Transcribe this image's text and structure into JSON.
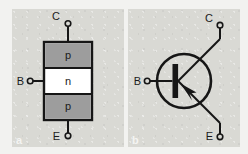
{
  "figure": {
    "background_color": "#f2f2f0",
    "panel_color": "#d9d9d4"
  },
  "panels": [
    {
      "id": "a",
      "caption": "a",
      "kind": "layer-structure",
      "body_fill": "#ffffff",
      "region_fill": "#9d9d9d",
      "stroke": "#161616",
      "regions": [
        {
          "label": "p",
          "position": "top"
        },
        {
          "label": "n",
          "position": "middle"
        },
        {
          "label": "p",
          "position": "bottom"
        }
      ],
      "terminals": [
        {
          "label": "C",
          "name": "collector",
          "position": "top"
        },
        {
          "label": "B",
          "name": "base",
          "position": "left"
        },
        {
          "label": "E",
          "name": "emitter",
          "position": "bottom"
        }
      ]
    },
    {
      "id": "b",
      "caption": "b",
      "kind": "circuit-symbol",
      "symbol_type": "pnp-transistor",
      "stroke": "#161616",
      "arrow_direction": "toward-base",
      "terminals": [
        {
          "label": "C",
          "name": "collector",
          "position": "top-right"
        },
        {
          "label": "B",
          "name": "base",
          "position": "left"
        },
        {
          "label": "E",
          "name": "emitter",
          "position": "bottom-right"
        }
      ]
    }
  ]
}
